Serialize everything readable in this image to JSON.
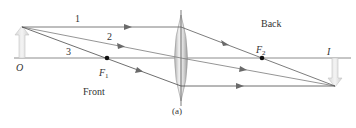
{
  "diagram": {
    "caption": "(a)",
    "regions": {
      "front": "Front",
      "back": "Back"
    },
    "object": {
      "label": "O",
      "x": 22,
      "base_y": 58,
      "tip_y": 27
    },
    "image": {
      "label": "I",
      "x": 335,
      "base_y": 58,
      "tip_y": 86
    },
    "lens": {
      "cx": 181,
      "top": 15,
      "bottom": 101,
      "half_width": 7
    },
    "focal_points": [
      {
        "label": "F",
        "sub": "1",
        "x": 107,
        "y": 58
      },
      {
        "label": "F",
        "sub": "2",
        "x": 262,
        "y": 58
      }
    ],
    "rays": [
      {
        "label": "1",
        "points": [
          [
            22,
            27
          ],
          [
            181,
            27
          ],
          [
            335,
            86
          ]
        ]
      },
      {
        "label": "2",
        "points": [
          [
            22,
            27
          ],
          [
            181,
            58
          ],
          [
            335,
            86
          ]
        ]
      },
      {
        "label": "3",
        "points": [
          [
            22,
            27
          ],
          [
            181,
            86
          ],
          [
            335,
            86
          ]
        ]
      }
    ],
    "colors": {
      "axis": "#8a8a8a",
      "ray": "#555555",
      "arrow_fill": "#e6e6e6",
      "arrow_stroke": "#c8c8c8",
      "lens_light": "#f2f2f2",
      "lens_dark": "#a8a8a8",
      "text": "#333333"
    }
  }
}
